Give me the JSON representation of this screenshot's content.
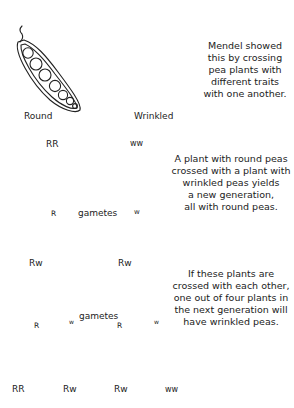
{
  "pods": {
    "left_label": "Round",
    "right_label": "Wrinkled"
  },
  "captions": {
    "intro": [
      "Mendel showed",
      "this by crossing",
      "pea plants with",
      "different traits",
      "with one another."
    ],
    "first_cross": [
      "A plant with round peas",
      "crossed with a plant with",
      "wrinkled peas yields",
      "a new generation,",
      "all with round peas."
    ],
    "second_cross": [
      "If these plants are",
      "crossed with each other,",
      "one out of four plants in",
      "the next generation will",
      "have wrinkled peas."
    ]
  },
  "parents": {
    "left_genotype": "RR",
    "right_genotype": "ww"
  },
  "gametes_label_1": "gametes",
  "gametes_label_2": "gametes",
  "gamete_symbols": {
    "R": "R",
    "w": "w"
  },
  "f1": {
    "left_genotype": "Rw",
    "right_genotype": "Rw"
  },
  "f2": {
    "genotypes": [
      "RR",
      "Rw",
      "Rw",
      "ww"
    ]
  }
}
